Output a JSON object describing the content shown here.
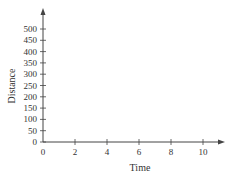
{
  "chart_data": {
    "type": "line",
    "title": "",
    "xlabel": "Time",
    "ylabel": "Distance",
    "xlim": [
      0,
      10
    ],
    "ylim": [
      0,
      500
    ],
    "x_ticks": [
      0,
      2,
      4,
      6,
      8,
      10
    ],
    "y_ticks": [
      0,
      50,
      100,
      150,
      200,
      250,
      300,
      350,
      400,
      450,
      500
    ],
    "grid": false,
    "legend": null,
    "series": [],
    "axes_arrows": true
  },
  "colors": {
    "axis": "#444444",
    "text": "#333333"
  }
}
